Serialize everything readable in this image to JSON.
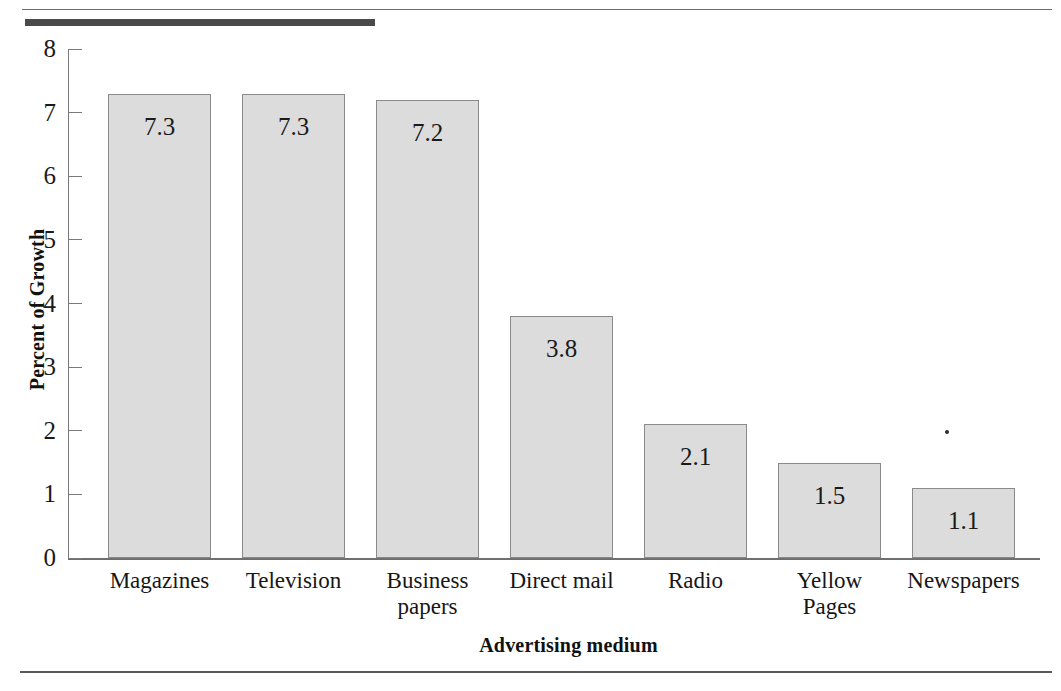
{
  "chart_data": {
    "type": "bar",
    "title": "",
    "xlabel": "Advertising medium",
    "ylabel": "Percent of Growth",
    "categories": [
      "Magazines",
      "Television",
      "Business papers",
      "Direct mail",
      "Radio",
      "Yellow Pages",
      "Newspapers"
    ],
    "category_lines": [
      [
        "Magazines"
      ],
      [
        "Television"
      ],
      [
        "Business",
        "papers"
      ],
      [
        "Direct mail"
      ],
      [
        "Radio"
      ],
      [
        "Yellow",
        "Pages"
      ],
      [
        "Newspapers"
      ]
    ],
    "values": [
      7.3,
      7.3,
      7.2,
      3.8,
      2.1,
      1.5,
      1.1
    ],
    "value_labels": [
      "7.3",
      "7.3",
      "7.2",
      "3.8",
      "2.1",
      "1.5",
      "1.1"
    ],
    "ylim": [
      0,
      8
    ],
    "yticks": [
      0,
      1,
      2,
      3,
      4,
      5,
      6,
      7,
      8
    ],
    "ytick_labels": [
      "0",
      "1",
      "2",
      "3",
      "4",
      "5",
      "6",
      "7",
      "8"
    ],
    "grid": false,
    "legend": null,
    "bar_fill_color": "#dcdcdc",
    "bar_border_color": "#8a8a8a",
    "text_color": "#1a1a1a"
  }
}
